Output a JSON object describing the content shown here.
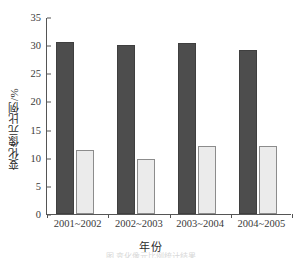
{
  "chart_data": {
    "type": "bar",
    "title": "",
    "xlabel": "年份",
    "ylabel": "变化像元比例/%",
    "categories": [
      "2001~2002",
      "2002~2003",
      "2003~2004",
      "2004~2005"
    ],
    "series": [
      {
        "name": "series-1",
        "color": "#4d4d4d",
        "values": [
          30.5,
          30.0,
          30.3,
          29.2
        ]
      },
      {
        "name": "series-2",
        "color": "#ebebeb",
        "values": [
          11.4,
          9.8,
          12.1,
          12.1
        ]
      }
    ],
    "ylim": [
      0,
      35
    ],
    "yticks": [
      0,
      5,
      10,
      15,
      20,
      25,
      30,
      35
    ],
    "ytick_labels": [
      "0",
      "5",
      "10",
      "15",
      "20",
      "25",
      "30",
      "35"
    ],
    "grid": false,
    "legend": "none"
  },
  "caption": {
    "bottom_strip": "图 变化像元比例统计结果"
  }
}
